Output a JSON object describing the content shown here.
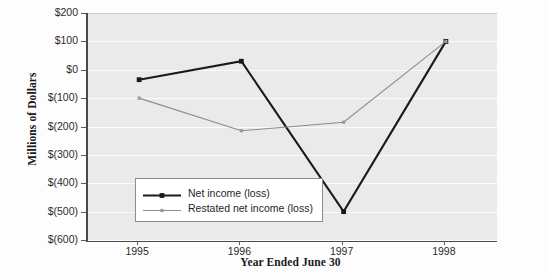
{
  "chart_data": {
    "type": "line",
    "title": "",
    "xlabel": "Year Ended June 30",
    "ylabel": "Millions of Dollars",
    "categories": [
      "1995",
      "1996",
      "1997",
      "1998"
    ],
    "x": [
      1995,
      1996,
      1997,
      1998
    ],
    "ylim": [
      -600,
      200
    ],
    "yticks": [
      200,
      100,
      0,
      -100,
      -200,
      -300,
      -400,
      -500,
      -600
    ],
    "ytick_labels": [
      "$200",
      "$100",
      "$0",
      "$(100)",
      "$(200)",
      "$(300)",
      "$(400)",
      "$(500)",
      "$(600)"
    ],
    "grid": true,
    "legend_position": "inside-lower-left",
    "series": [
      {
        "name": "Net income (loss)",
        "color": "#1a1a1a",
        "marker": "square",
        "values": [
          -35,
          30,
          -500,
          100
        ]
      },
      {
        "name": "Restated net income (loss)",
        "color": "#8c8c8c",
        "marker": "star",
        "values": [
          -100,
          -215,
          -185,
          100
        ]
      }
    ]
  },
  "axes": {
    "y_title": "Millions of Dollars",
    "x_title": "Year Ended June 30"
  },
  "legend": {
    "entries": [
      {
        "label": "Net income (loss)"
      },
      {
        "label": "Restated net income (loss)"
      }
    ]
  },
  "colors": {
    "plot_background": "#eaeaea",
    "gridline": "#fbfbfb",
    "axis": "#4a4a4a",
    "series_primary": "#1a1a1a",
    "series_secondary": "#8c8c8c",
    "legend_background": "#ffffff",
    "legend_border": "#8d8d8d",
    "text": "#1f1f1f"
  }
}
